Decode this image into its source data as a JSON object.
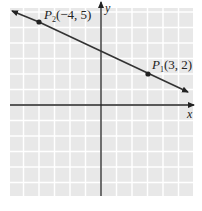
{
  "chart_data": {
    "type": "line",
    "title": "",
    "xlabel": "x",
    "ylabel": "y",
    "xlim": [
      -6,
      6
    ],
    "ylim": [
      -6,
      6
    ],
    "grid": true,
    "series": [
      {
        "name": "line through P1 and P2",
        "points": [
          {
            "label": "P2(-4, 5)",
            "x": -4,
            "y": 5
          },
          {
            "label": "P1(3, 2)",
            "x": 3,
            "y": 2
          }
        ],
        "slope": -0.4286,
        "arrows_both_ends": true
      }
    ],
    "annotations": [
      "P2(-4, 5)",
      "P1(3, 2)"
    ]
  },
  "labels": {
    "p2_main": "P",
    "p2_sub": "2",
    "p2_coords": "(−4, 5)",
    "p1_main": "P",
    "p1_sub": "1",
    "p1_coords": "(3, 2)",
    "x_axis": "x",
    "y_axis": "y"
  },
  "colors": {
    "grid_bg": "#e8e8e8",
    "grid_lines": "#ffffff",
    "axes": "#222222",
    "line": "#333333"
  }
}
